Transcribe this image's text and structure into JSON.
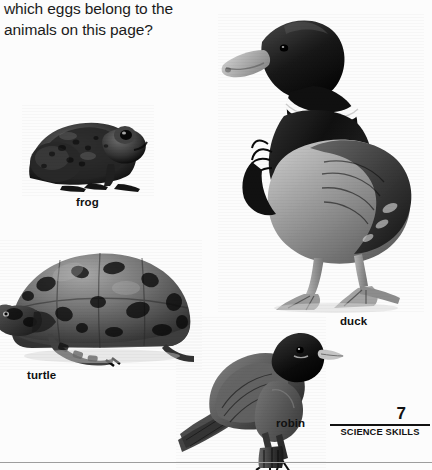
{
  "page": {
    "background_color": "#fcfcfc",
    "ink_color": "#111111"
  },
  "question": {
    "cut_off_line": "How can you tell",
    "line1": "which eggs belong to the",
    "line2": "animals on this page?"
  },
  "animals": [
    {
      "name": "frog",
      "label": "frog",
      "photo": "frog-photo"
    },
    {
      "name": "duck",
      "label": "duck",
      "photo": "duck-photo"
    },
    {
      "name": "turtle",
      "label": "turtle",
      "photo": "turtle-photo"
    },
    {
      "name": "robin",
      "label": "robin",
      "photo": "robin-photo"
    }
  ],
  "footer": {
    "page_number": "7",
    "section_label": "SCIENCE SKILLS"
  }
}
